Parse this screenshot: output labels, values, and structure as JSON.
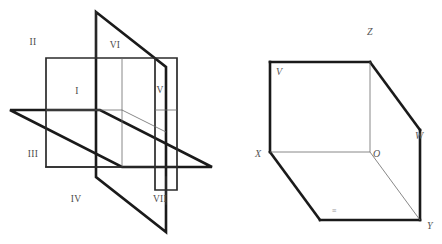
{
  "figure": {
    "background_color": "#ffffff",
    "stroke_color": "#1a1a1a",
    "thin_stroke_color": "#6a6a6a",
    "label_color": "#4a4a4a"
  },
  "left_diagram": {
    "name": "three-intersecting-coordinate-planes",
    "octant_labels": [
      {
        "text": "II",
        "x": 33,
        "y": 45
      },
      {
        "text": "VI",
        "x": 115,
        "y": 48
      },
      {
        "text": "I",
        "x": 77,
        "y": 94
      },
      {
        "text": "V",
        "x": 160,
        "y": 93
      },
      {
        "text": "III",
        "x": 33,
        "y": 157
      },
      {
        "text": "IV",
        "x": 76,
        "y": 202
      },
      {
        "text": "VII",
        "x": 160,
        "y": 202
      }
    ]
  },
  "right_diagram": {
    "name": "coordinate-trihedron",
    "vertex_labels": [
      {
        "text": "V",
        "x": 276,
        "y": 75
      },
      {
        "text": "Z",
        "x": 367,
        "y": 35
      },
      {
        "text": "W",
        "x": 415,
        "y": 139
      },
      {
        "text": "X",
        "x": 261,
        "y": 157
      },
      {
        "text": "O",
        "x": 373,
        "y": 157
      },
      {
        "text": "Y",
        "x": 427,
        "y": 229
      }
    ],
    "faint_marks": [
      {
        "text": "≡",
        "x": 332,
        "y": 213
      }
    ]
  }
}
